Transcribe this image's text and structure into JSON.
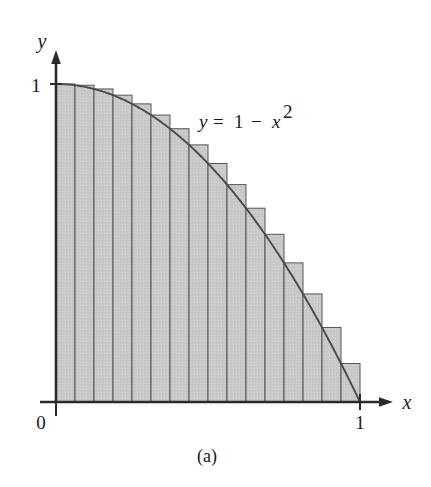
{
  "figure": {
    "caption": "(a)",
    "equation_label": "y = 1 − x²",
    "equation_parts": {
      "y": "y",
      "equals": "=",
      "one": "1",
      "minus": "−",
      "x": "x",
      "exponent": "2"
    },
    "axes": {
      "x_axis_label": "x",
      "y_axis_label": "y",
      "origin_label": "0",
      "x_tick_label": "1",
      "y_tick_label": "1"
    },
    "colors": {
      "fill": "#c9c9c9",
      "fill_dark": "#bcbcbc",
      "stroke": "#555555",
      "curve": "#4a4a4a",
      "axis": "#2a2a2a",
      "text": "#1a1a1a",
      "background": "#ffffff"
    }
  },
  "chart_data": {
    "type": "area",
    "title": "",
    "subtitle": "",
    "xlabel": "x",
    "ylabel": "y",
    "xlim": [
      0,
      1
    ],
    "ylim": [
      0,
      1
    ],
    "grid": false,
    "legend": null,
    "annotations": [
      {
        "text": "y = 1 − x²",
        "x": 0.52,
        "y": 0.8
      },
      {
        "text": "(a)",
        "x": 0.5,
        "y": -0.18
      }
    ],
    "curve": {
      "name": "y = 1 - x^2",
      "function": "1 - x^2",
      "x": [
        0,
        0.05,
        0.1,
        0.15,
        0.2,
        0.25,
        0.3,
        0.35,
        0.4,
        0.45,
        0.5,
        0.55,
        0.6,
        0.65,
        0.7,
        0.75,
        0.8,
        0.85,
        0.9,
        0.95,
        1
      ],
      "y": [
        1,
        0.9975,
        0.99,
        0.9775,
        0.96,
        0.9375,
        0.91,
        0.8775,
        0.84,
        0.7975,
        0.75,
        0.6975,
        0.64,
        0.5775,
        0.51,
        0.4375,
        0.36,
        0.2775,
        0.19,
        0.0975,
        0
      ]
    },
    "rectangles": {
      "description": "Left-endpoint (inscribed-from-left) approximating rectangles of equal width under y = 1 - x^2 on [0,1]",
      "n": 16,
      "width": 0.0625,
      "endpoint_rule": "left",
      "left_edges": [
        0,
        0.0625,
        0.125,
        0.1875,
        0.25,
        0.3125,
        0.375,
        0.4375,
        0.5,
        0.5625,
        0.625,
        0.6875,
        0.75,
        0.8125,
        0.875,
        0.9375
      ],
      "heights": [
        1,
        0.99609,
        0.98438,
        0.96484,
        0.9375,
        0.90234,
        0.85938,
        0.80859,
        0.75,
        0.68359,
        0.60938,
        0.52734,
        0.4375,
        0.33984,
        0.23438,
        0.12109
      ],
      "total_area_estimate": 0.70703
    }
  }
}
